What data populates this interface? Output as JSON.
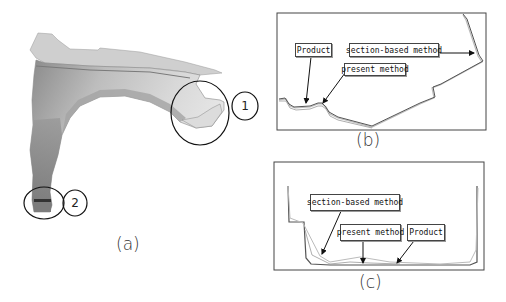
{
  "figure": {
    "panel_a": {
      "caption": "(a)",
      "description": "front fender panel",
      "callouts": [
        {
          "id": "1",
          "label": "1"
        },
        {
          "id": "2",
          "label": "2"
        }
      ]
    },
    "panel_b": {
      "caption": "(b)",
      "labels": {
        "product": "Product",
        "section_based": "section-based method",
        "present": "present method"
      }
    },
    "panel_c": {
      "caption": "(c)",
      "labels": {
        "section_based": "section-based method",
        "present": "present method",
        "product": "Product"
      }
    }
  }
}
